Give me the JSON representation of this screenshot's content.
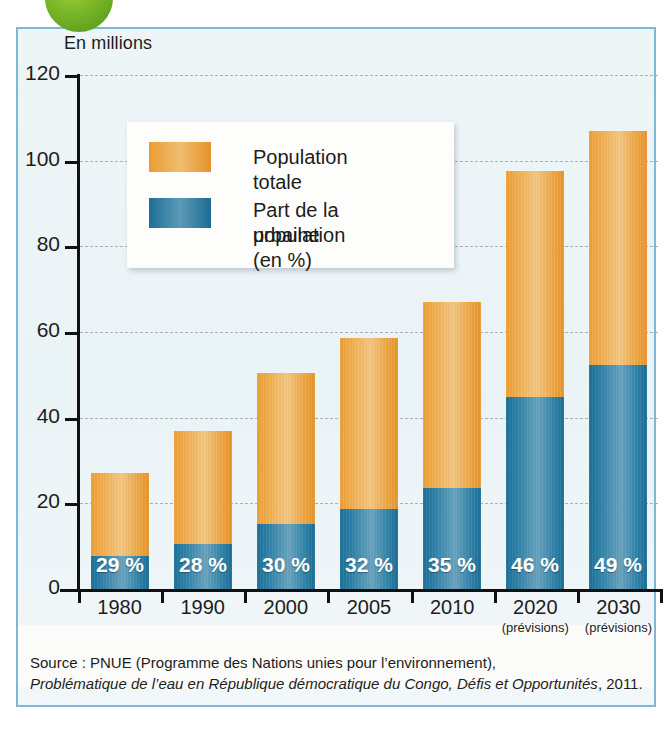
{
  "decor": {
    "bubble": "green-circle",
    "panel_border_color": "#7fb8d4",
    "panel_bg_color": "#eaf3f6"
  },
  "axis_title": "En millions",
  "legend": {
    "items": [
      {
        "label": "Population totale",
        "color": "#eb9c33",
        "icon": "orange-swatch"
      },
      {
        "label": "Part de la population urbaine (en %)",
        "line1": "Part de la population",
        "line2": "urbaine (en %)",
        "color": "#1c6f96",
        "icon": "blue-swatch"
      }
    ]
  },
  "source": {
    "line1": "Source : PNUE (Programme des Nations unies pour l’environnement),",
    "line2_italic": "Problématique de l’eau en République démocratique du Congo, Défis et Opportunités",
    "line2_tail": ", 2011."
  },
  "chart_data": {
    "type": "bar",
    "title": "",
    "subtitle": "",
    "xlabel": "",
    "ylabel": "En millions",
    "ylim": [
      0,
      120
    ],
    "yticks": [
      0,
      20,
      40,
      60,
      80,
      100,
      120
    ],
    "ytick_labels": [
      "0",
      "20",
      "40",
      "60",
      "80",
      "100",
      "120"
    ],
    "grid": true,
    "legend_position": "upper-left-inside",
    "categories": [
      "1980",
      "1990",
      "2000",
      "2005",
      "2010",
      "2020",
      "2030"
    ],
    "category_sublabels": [
      "",
      "",
      "",
      "",
      "",
      "(prévisions)",
      "(prévisions)"
    ],
    "series": [
      {
        "name": "Population totale",
        "color": "#eb9c33",
        "unit": "millions",
        "values": [
          27,
          37,
          50.5,
          58.5,
          67,
          97.5,
          107
        ]
      },
      {
        "name": "Part de la population urbaine (en %)",
        "color": "#1c6f96",
        "unit": "millions",
        "values": [
          7.8,
          10.4,
          15.2,
          18.7,
          23.5,
          44.9,
          52.4
        ],
        "data_labels": [
          "29 %",
          "28 %",
          "30 %",
          "32 %",
          "35 %",
          "46 %",
          "49 %"
        ],
        "percent_values": [
          29,
          28,
          30,
          32,
          35,
          46,
          49
        ]
      }
    ],
    "stacked": true
  }
}
